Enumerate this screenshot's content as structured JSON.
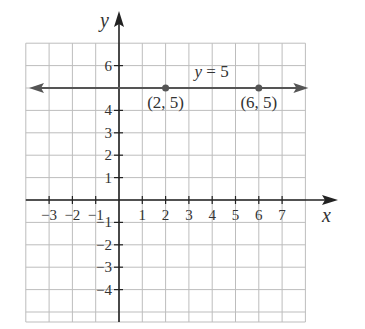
{
  "chart_data": {
    "type": "line",
    "title": "",
    "xlabel": "x",
    "ylabel": "y",
    "xlim": [
      -4,
      8
    ],
    "ylim": [
      -5,
      7
    ],
    "grid": true,
    "x_ticks": [
      -3,
      -2,
      -1,
      1,
      2,
      3,
      4,
      5,
      6,
      7
    ],
    "x_tick_labels": [
      "−3",
      "−2",
      "−1",
      "1",
      "2",
      "3",
      "4",
      "5",
      "6",
      "7"
    ],
    "y_ticks": [
      6,
      4,
      3,
      2,
      1,
      -1,
      -2,
      -3,
      -4
    ],
    "y_tick_labels": [
      "6",
      "4",
      "3",
      "2",
      "1",
      "−1",
      "−2",
      "−3",
      "−4"
    ],
    "series": [
      {
        "name": "y = 5",
        "type": "horizontal-line",
        "y": 5,
        "arrows": "both"
      }
    ],
    "points": [
      {
        "x": 2,
        "y": 5,
        "label": "(2, 5)"
      },
      {
        "x": 6,
        "y": 5,
        "label": "(6, 5)"
      }
    ],
    "annotations": [
      {
        "text": "y = 5",
        "x": 3.5,
        "y": 5.6
      }
    ]
  },
  "labels": {
    "x_axis": "x",
    "y_axis": "y",
    "line_label": "y = 5",
    "point1": "(2, 5)",
    "point2": "(6, 5)"
  },
  "colors": {
    "grid": "#bdbdbd",
    "axis": "#222222",
    "line": "#555555",
    "point": "#555555"
  }
}
